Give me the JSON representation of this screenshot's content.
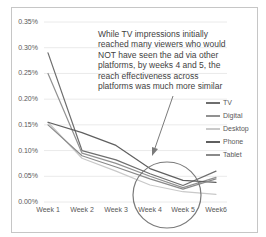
{
  "callout": {
    "lines": [
      "While TV impressions initially",
      "reached many viewers who would",
      "NOT have seen the ad via other",
      "platforms, by weeks 4 and 5, the",
      "reach effectiveness across",
      "platforms was much more similar"
    ],
    "circled_weeks": [
      "Week 4",
      "Week 5"
    ]
  },
  "chart_data": {
    "type": "line",
    "title": "",
    "xlabel": "",
    "ylabel": "",
    "y_unit": "%",
    "grid": true,
    "legend_position": "right",
    "categories": [
      "Week 1",
      "Week 2",
      "Week 3",
      "Week 4",
      "Week 5",
      "Week6"
    ],
    "ylim": [
      0,
      0.35
    ],
    "yticks": [
      {
        "label": "0.35%",
        "value": 0.35
      },
      {
        "label": "0.30%",
        "value": 0.3
      },
      {
        "label": "0.25%",
        "value": 0.25
      },
      {
        "label": "0.20%",
        "value": 0.2
      },
      {
        "label": "0.15%",
        "value": 0.15
      },
      {
        "label": "0.10%",
        "value": 0.1
      },
      {
        "label": "0.05%",
        "value": 0.05
      },
      {
        "label": "0.00%",
        "value": 0.0
      }
    ],
    "series": [
      {
        "name": "TV",
        "color": "#6e6e6e",
        "values": [
          0.29,
          0.1,
          0.082,
          0.055,
          0.032,
          0.06
        ]
      },
      {
        "name": "Digital",
        "color": "#919191",
        "values": [
          0.25,
          0.095,
          0.075,
          0.05,
          0.028,
          0.048
        ]
      },
      {
        "name": "Desktop",
        "color": "#c9c9c9",
        "values": [
          0.155,
          0.085,
          0.06,
          0.033,
          0.02,
          0.015
        ]
      },
      {
        "name": "Phone",
        "color": "#5f5f5f",
        "values": [
          0.155,
          0.135,
          0.11,
          0.065,
          0.042,
          0.038
        ]
      },
      {
        "name": "Tablet",
        "color": "#8a8a8a",
        "values": [
          0.15,
          0.09,
          0.068,
          0.045,
          0.025,
          0.045
        ]
      }
    ],
    "annotation_shapes": {
      "circle_color": "#7a7a7a",
      "arrow_color": "#7a7a7a"
    }
  },
  "frame": {
    "border_color": "#c6c6c6",
    "gridline_color": "#eaeaea"
  }
}
